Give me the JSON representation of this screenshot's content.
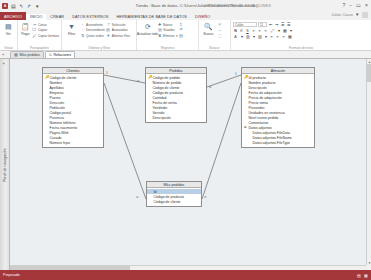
{
  "window": {
    "title": "Tienda : Base de datos- C:\\Users\\Julián\\Documents\\Tienda.accdb (...",
    "contextual_title": "HERRAMIENTAS DE RELACIONES",
    "user": "Julián Casas",
    "quick_access": [
      "save-icon",
      "undo-icon",
      "redo-icon"
    ],
    "window_buttons": [
      "help-icon",
      "minimize-icon",
      "restore-icon",
      "close-icon"
    ]
  },
  "ribbon": {
    "tabs": [
      {
        "label": "ARCHIVO",
        "type": "file"
      },
      {
        "label": "INICIO",
        "type": "active"
      },
      {
        "label": "CREAR",
        "type": "normal"
      },
      {
        "label": "DATOS EXTERNOS",
        "type": "normal"
      },
      {
        "label": "HERRAMIENTAS DE BASE DE DATOS",
        "type": "normal"
      },
      {
        "label": "DISEÑO",
        "type": "contextual"
      }
    ],
    "groups": [
      {
        "label": "Vistas",
        "big": [
          {
            "label": "Ver",
            "icon": "view-icon"
          }
        ],
        "small": []
      },
      {
        "label": "Portapapeles",
        "big": [
          {
            "label": "Pegar",
            "icon": "paste-icon"
          }
        ],
        "small": [
          {
            "label": "Cortar",
            "icon": "cut-icon"
          },
          {
            "label": "Copiar",
            "icon": "copy-icon"
          },
          {
            "label": "Copiar formato",
            "icon": "format-painter-icon"
          }
        ]
      },
      {
        "label": "Ordenar y filtrar",
        "big": [
          {
            "label": "Filtro",
            "icon": "filter-icon"
          }
        ],
        "small": [
          {
            "label": "Ascendente",
            "icon": "sort-asc-icon"
          },
          {
            "label": "Descendente",
            "icon": "sort-desc-icon"
          },
          {
            "label": "Quitar orden",
            "icon": "clear-sort-icon"
          },
          {
            "label": "Selección",
            "icon": "selection-icon"
          },
          {
            "label": "Avanzadas",
            "icon": "advanced-icon"
          },
          {
            "label": "Alternar filtro",
            "icon": "toggle-filter-icon"
          }
        ]
      },
      {
        "label": "Registros",
        "big": [
          {
            "label": "Actualizar todo",
            "icon": "refresh-icon"
          }
        ],
        "small": [
          {
            "label": "Nuevo",
            "icon": "new-record-icon"
          },
          {
            "label": "Guardar",
            "icon": "save-record-icon"
          },
          {
            "label": "Eliminar",
            "icon": "delete-record-icon"
          },
          {
            "label": "Totales",
            "icon": "totals-icon"
          },
          {
            "label": "Revisión ortográfica",
            "icon": "spelling-icon"
          },
          {
            "label": "Más",
            "icon": "more-icon"
          }
        ]
      },
      {
        "label": "Buscar",
        "big": [
          {
            "label": "Buscar",
            "icon": "find-icon"
          }
        ],
        "small": [
          {
            "label": "Reemplazar",
            "icon": "replace-icon"
          },
          {
            "label": "Ir a",
            "icon": "goto-icon"
          },
          {
            "label": "Seleccionar",
            "icon": "select-icon"
          }
        ]
      },
      {
        "label": "Formato de texto",
        "font": {
          "name": "Calibri",
          "size": "11"
        },
        "buttons": [
          "N",
          "K",
          "S",
          "align-left-icon",
          "align-center-icon",
          "align-right-icon",
          "A",
          "highlight-icon",
          "font-color-icon",
          "bullets-icon",
          "numbering-icon",
          "decrease-indent-icon",
          "increase-indent-icon",
          "borders-icon",
          "datasheet-icon"
        ]
      }
    ]
  },
  "document_tabs": [
    {
      "label": "Más pedidos",
      "icon": "query-icon",
      "active": false
    },
    {
      "label": "Relaciones",
      "icon": "relationships-icon",
      "active": true
    }
  ],
  "navigation_pane": {
    "label": "Panel de navegación",
    "arrow": "»"
  },
  "tables": [
    {
      "name": "Clientes",
      "x": 32,
      "y": 8,
      "width": 62,
      "fields": [
        {
          "label": "Código de cliente",
          "pk": true
        },
        {
          "label": "Nombre",
          "pk": false
        },
        {
          "label": "Apellidos",
          "pk": false
        },
        {
          "label": "Empresa",
          "pk": false
        },
        {
          "label": "Puesto",
          "pk": false
        },
        {
          "label": "Dirección",
          "pk": false
        },
        {
          "label": "Población",
          "pk": false
        },
        {
          "label": "Código postal",
          "pk": false
        },
        {
          "label": "Provincia",
          "pk": false
        },
        {
          "label": "Número teléfono",
          "pk": false
        },
        {
          "label": "Fecha nacimiento",
          "pk": false
        },
        {
          "label": "Página Web",
          "pk": false
        },
        {
          "label": "Casado",
          "pk": false
        },
        {
          "label": "Número hijos",
          "pk": false
        }
      ]
    },
    {
      "name": "Pedidos",
      "x": 135,
      "y": 8,
      "width": 62,
      "fields": [
        {
          "label": "Código de pedido",
          "pk": true
        },
        {
          "label": "Número de pedido",
          "pk": false
        },
        {
          "label": "Código de cliente",
          "pk": false
        },
        {
          "label": "Código de producto",
          "pk": false
        },
        {
          "label": "Cantidad",
          "pk": false
        },
        {
          "label": "Fecha de venta",
          "pk": false
        },
        {
          "label": "Vendedor",
          "pk": false
        },
        {
          "label": "Servido",
          "pk": false
        },
        {
          "label": "Descripción",
          "pk": false
        }
      ]
    },
    {
      "name": "Almacén",
      "x": 231,
      "y": 8,
      "width": 74,
      "fields": [
        {
          "label": "Id producto",
          "pk": true
        },
        {
          "label": "Nombre producto",
          "pk": false
        },
        {
          "label": "Descripción",
          "pk": false
        },
        {
          "label": "Fecha de adquisición",
          "pk": false
        },
        {
          "label": "Precio de adquisición",
          "pk": false
        },
        {
          "label": "Precio venta",
          "pk": false
        },
        {
          "label": "Proveedor",
          "pk": false
        },
        {
          "label": "Unidades en existencia",
          "pk": false
        },
        {
          "label": "Nivel nuevo pedido",
          "pk": false
        },
        {
          "label": "Comentarios",
          "pk": false
        },
        {
          "label": "Datos adjuntos",
          "pk": false,
          "expand": "⊞"
        },
        {
          "label": "Datos adjuntos.FileData",
          "pk": false,
          "indent": true
        },
        {
          "label": "Datos adjuntos.FileName",
          "pk": false,
          "indent": true
        },
        {
          "label": "Datos adjuntos.FileType",
          "pk": false,
          "indent": true
        }
      ]
    },
    {
      "name": "Más pedidos",
      "x": 136,
      "y": 122,
      "width": 56,
      "fields": [
        {
          "label": "Id",
          "pk": false,
          "selected": true
        },
        {
          "label": "Código de producto",
          "pk": false
        },
        {
          "label": "Código de cliente",
          "pk": false
        }
      ]
    }
  ],
  "relationships": [
    {
      "from": "Clientes",
      "to": "Pedidos",
      "one": "1",
      "many": "∞"
    },
    {
      "from": "Pedidos",
      "to": "Almacén",
      "one": "1",
      "many": "∞"
    },
    {
      "from": "Clientes",
      "to": "Más pedidos",
      "one": "1",
      "many": "∞"
    },
    {
      "from": "Almacén",
      "to": "Más pedidos",
      "one": "1",
      "many": "∞"
    }
  ],
  "statusbar": {
    "text": "Preparado",
    "icons": [
      "layout-icon",
      "design-icon"
    ]
  }
}
